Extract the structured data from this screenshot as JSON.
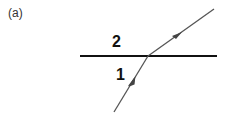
{
  "figure": {
    "panel_label": "(a)",
    "media": [
      {
        "id": "medium-2",
        "label": "2",
        "position": "above interface"
      },
      {
        "id": "medium-1",
        "label": "1",
        "position": "below interface"
      }
    ],
    "interface": {
      "x1": 80,
      "y1": 56,
      "x2": 217,
      "y2": 56,
      "color": "#111111"
    },
    "rays": [
      {
        "name": "incident-ray",
        "x1": 114,
        "y1": 112,
        "x2": 148,
        "y2": 56,
        "color": "#555555",
        "arrow_at": [
          132,
          83
        ],
        "direction": "toward interface"
      },
      {
        "name": "refracted-ray",
        "x1": 148,
        "y1": 56,
        "x2": 214,
        "y2": 9,
        "color": "#555555",
        "arrow_at": [
          178,
          35
        ],
        "direction": "away from interface"
      }
    ]
  }
}
